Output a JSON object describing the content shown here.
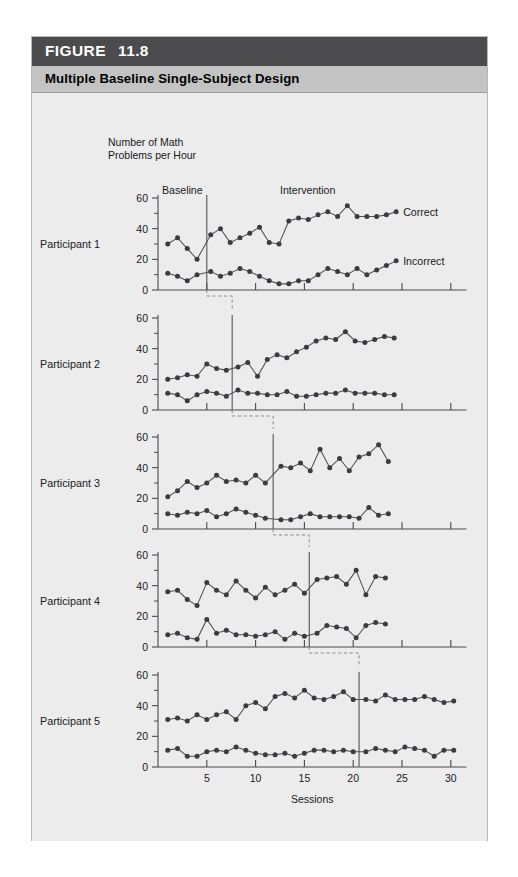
{
  "figure": {
    "label": "FIGURE",
    "number": "11.8",
    "title": "Multiple Baseline Single-Subject Design",
    "header_bg": "#4b4b4d",
    "subheader_bg": "#c3c3c4",
    "panel_bg": "#ececed"
  },
  "axes": {
    "y_axis_title_line1": "Number of Math",
    "y_axis_title_line2": "Problems per Hour",
    "x_axis_title": "Sessions",
    "y_ticks": [
      "0",
      "20",
      "40",
      "60"
    ],
    "y_tick_values": [
      0,
      20,
      40,
      60
    ],
    "y_minor_values": [
      10,
      30,
      50
    ],
    "x_ticks": [
      "5",
      "10",
      "15",
      "20",
      "25",
      "30"
    ],
    "x_tick_values": [
      5,
      10,
      15,
      20,
      25,
      30
    ],
    "xlim": [
      0,
      31.5
    ],
    "ylim": [
      0,
      65
    ]
  },
  "annotations": {
    "baseline": "Baseline",
    "intervention": "Intervention",
    "correct": "Correct",
    "incorrect": "Incorrect"
  },
  "panel_labels": [
    "Participant 1",
    "Participant 2",
    "Participant 3",
    "Participant 4",
    "Participant 5"
  ],
  "chart_data": {
    "type": "line",
    "title": "Multiple Baseline Single-Subject Design",
    "xlabel": "Sessions",
    "ylabel": "Number of Math Problems per Hour",
    "xlim": [
      0,
      31.5
    ],
    "ylim": [
      0,
      65
    ],
    "grid": false,
    "legend_position": "right-inline",
    "legend": [
      "Correct",
      "Incorrect"
    ],
    "phase_labels": [
      "Baseline",
      "Intervention"
    ],
    "panels": [
      {
        "name": "Participant 1",
        "phase_change_session": 5.0,
        "series": [
          {
            "name": "Correct",
            "x": [
              1,
              2,
              3,
              4,
              5.4,
              6.4,
              7.4,
              8.4,
              9.4,
              10.4,
              11.4,
              12.4,
              13.4,
              14.4,
              15.4,
              16.4,
              17.4,
              18.4,
              19.4,
              20.4,
              21.4,
              22.4,
              23.4,
              24.4
            ],
            "values": [
              30,
              34,
              27,
              20,
              36,
              40,
              31,
              34,
              37,
              41,
              31,
              30,
              45,
              47,
              46,
              49,
              51,
              48,
              55,
              48,
              48,
              48,
              49,
              51
            ]
          },
          {
            "name": "Incorrect",
            "x": [
              1,
              2,
              3,
              4,
              5.4,
              6.4,
              7.4,
              8.4,
              9.4,
              10.4,
              11.4,
              12.4,
              13.4,
              14.4,
              15.4,
              16.4,
              17.4,
              18.4,
              19.4,
              20.4,
              21.4,
              22.4,
              23.4,
              24.4
            ],
            "values": [
              11,
              9,
              6,
              10,
              12,
              9,
              11,
              14,
              12,
              9,
              6,
              4,
              4,
              6,
              6,
              10,
              14,
              12,
              10,
              14,
              10,
              13,
              16,
              19
            ]
          }
        ]
      },
      {
        "name": "Participant 2",
        "phase_change_session": 7.6,
        "series": [
          {
            "name": "Correct",
            "x": [
              1,
              2,
              3,
              4,
              5,
              6,
              7,
              8.2,
              9.2,
              10.2,
              11.2,
              12.2,
              13.2,
              14.2,
              15.2,
              16.2,
              17.2,
              18.2,
              19.2,
              20.2,
              21.2,
              22.2,
              23.2,
              24.2
            ],
            "values": [
              20,
              21,
              23,
              22,
              30,
              27,
              26,
              28,
              31,
              22,
              33,
              36,
              34,
              38,
              41,
              45,
              47,
              46,
              51,
              45,
              44,
              46,
              48,
              47
            ]
          },
          {
            "name": "Incorrect",
            "x": [
              1,
              2,
              3,
              4,
              5,
              6,
              7,
              8.2,
              9.2,
              10.2,
              11.2,
              12.2,
              13.2,
              14.2,
              15.2,
              16.2,
              17.2,
              18.2,
              19.2,
              20.2,
              21.2,
              22.2,
              23.2,
              24.2
            ],
            "values": [
              11,
              10,
              6,
              10,
              12,
              11,
              9,
              13,
              11,
              11,
              10,
              10,
              12,
              9,
              9,
              10,
              11,
              11,
              13,
              11,
              11,
              11,
              10,
              10
            ]
          }
        ]
      },
      {
        "name": "Participant 3",
        "phase_change_session": 11.8,
        "series": [
          {
            "name": "Correct",
            "x": [
              1,
              2,
              3,
              4,
              5,
              6,
              7,
              8,
              9,
              10,
              11,
              12.6,
              13.6,
              14.6,
              15.6,
              16.6,
              17.6,
              18.6,
              19.6,
              20.6,
              21.6,
              22.6,
              23.6
            ],
            "values": [
              21,
              25,
              31,
              27,
              30,
              35,
              31,
              32,
              30,
              35,
              30,
              41,
              40,
              43,
              38,
              52,
              40,
              46,
              38,
              47,
              49,
              55,
              44,
              46
            ]
          },
          {
            "name": "Incorrect",
            "x": [
              1,
              2,
              3,
              4,
              5,
              6,
              7,
              8,
              9,
              10,
              11,
              12.6,
              13.6,
              14.6,
              15.6,
              16.6,
              17.6,
              18.6,
              19.6,
              20.6,
              21.6,
              22.6,
              23.6
            ],
            "values": [
              10,
              9,
              11,
              10,
              12,
              8,
              10,
              13,
              11,
              9,
              7,
              6,
              6,
              8,
              10,
              8,
              8,
              8,
              8,
              7,
              14,
              9,
              10
            ]
          }
        ]
      },
      {
        "name": "Participant 4",
        "phase_change_session": 15.5,
        "series": [
          {
            "name": "Correct",
            "x": [
              1,
              2,
              3,
              4,
              5,
              6,
              7,
              8,
              9,
              10,
              11,
              12,
              13,
              14,
              15,
              16.3,
              17.3,
              18.3,
              19.3,
              20.3,
              21.3,
              22.3,
              23.3
            ],
            "values": [
              36,
              37,
              31,
              27,
              42,
              37,
              34,
              43,
              37,
              32,
              39,
              34,
              37,
              41,
              35,
              44,
              45,
              46,
              41,
              50,
              34,
              46,
              45,
              40
            ]
          },
          {
            "name": "Incorrect",
            "x": [
              1,
              2,
              3,
              4,
              5,
              6,
              7,
              8,
              9,
              10,
              11,
              12,
              13,
              14,
              15,
              16.3,
              17.3,
              18.3,
              19.3,
              20.3,
              21.3,
              22.3,
              23.3
            ],
            "values": [
              8,
              9,
              6,
              5,
              18,
              9,
              11,
              8,
              8,
              7,
              8,
              10,
              5,
              9,
              7,
              9,
              14,
              13,
              12,
              6,
              14,
              16,
              15
            ]
          }
        ]
      },
      {
        "name": "Participant 5",
        "phase_change_session": 20.6,
        "series": [
          {
            "name": "Correct",
            "x": [
              1,
              2,
              3,
              4,
              5,
              6,
              7,
              8,
              9,
              10,
              11,
              12,
              13,
              14,
              15,
              16,
              17,
              18,
              19,
              20,
              21.3,
              22.3,
              23.3,
              24.3,
              25.3,
              26.3,
              27.3,
              28.3,
              29.3,
              30.3
            ],
            "values": [
              31,
              32,
              30,
              34,
              31,
              34,
              36,
              31,
              40,
              42,
              38,
              46,
              48,
              45,
              50,
              45,
              44,
              46,
              49,
              44,
              44,
              43,
              47,
              44,
              44,
              44,
              46,
              44,
              42,
              43
            ]
          },
          {
            "name": "Incorrect",
            "x": [
              1,
              2,
              3,
              4,
              5,
              6,
              7,
              8,
              9,
              10,
              11,
              12,
              13,
              14,
              15,
              16,
              17,
              18,
              19,
              20,
              21.3,
              22.3,
              23.3,
              24.3,
              25.3,
              26.3,
              27.3,
              28.3,
              29.3,
              30.3
            ],
            "values": [
              11,
              12,
              7,
              7,
              10,
              11,
              10,
              13,
              11,
              9,
              8,
              8,
              9,
              7,
              9,
              11,
              11,
              10,
              11,
              10,
              10,
              12,
              11,
              10,
              13,
              12,
              11,
              7,
              11,
              11
            ]
          }
        ]
      }
    ]
  }
}
